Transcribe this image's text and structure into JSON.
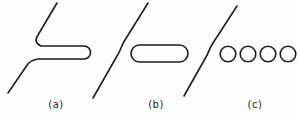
{
  "figure": {
    "background": "#fefefe",
    "stroke_color": "#1e1e1e",
    "stroke_width": 1.6,
    "panels": [
      {
        "id": "a",
        "label": "(a)",
        "shapes": [
          {
            "type": "path",
            "name": "fault-trace-with-open-tongue-a",
            "d": "M57,3 L38,35 Q33,42.5 41,46 L84,46 A6.5,6.5 0 0 1 84,59 L38,59 Q29.5,60.5 26.5,66 L8,93"
          }
        ]
      },
      {
        "id": "b",
        "label": "(b)",
        "shapes": [
          {
            "type": "path",
            "name": "jogged-fault-trace-b",
            "d": "M148,3 L125,40 C121,46 121,50 117,56 L93,98"
          },
          {
            "type": "path",
            "name": "elongate-cavity-b",
            "d": "M139.5,45 L179.5,45 A8.5,8.5 0 0 1 179.5,62 L139.5,62 A8.5,8.5 0 0 1 139.5,45 Z"
          }
        ]
      },
      {
        "id": "c",
        "label": "(c)",
        "shapes": [
          {
            "type": "path",
            "name": "jogged-fault-trace-c",
            "d": "M237,6 L213,43 C209,49 209,52 206,57 L184,96"
          },
          {
            "type": "circle",
            "name": "round-hole-c-1",
            "cx": 228,
            "cy": 54,
            "r": 7.8
          },
          {
            "type": "circle",
            "name": "round-hole-c-2",
            "cx": 248,
            "cy": 54,
            "r": 7.8
          },
          {
            "type": "circle",
            "name": "round-hole-c-3",
            "cx": 268,
            "cy": 54,
            "r": 7.8
          },
          {
            "type": "circle",
            "name": "round-hole-c-4",
            "cx": 288,
            "cy": 54,
            "r": 7.8
          }
        ]
      }
    ]
  }
}
